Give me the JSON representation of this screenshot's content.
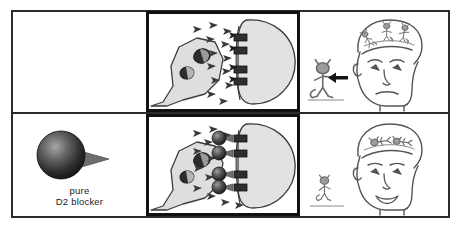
{
  "figure": {
    "type": "two-row comic panel diagram",
    "rows": [
      {
        "id": "row-untreated",
        "label": "untreated",
        "cells": [
          {
            "id": "top-left",
            "name": "empty-cell",
            "content": "",
            "description": "blank panel (no drug present)"
          },
          {
            "id": "top-middle",
            "name": "synapse-panel-untreated",
            "description": "dopamine synapse with free dopamine in cleft binding open D2 receptors",
            "elements": {
              "presynaptic_terminal": "presynaptic-neuron-terminal",
              "vesicles": 2,
              "neurotransmitter_count": 13,
              "receptor_count": 4,
              "receptors_occupied_by_blocker": 0,
              "postsynaptic_cell": "postsynaptic-neuron"
            }
          },
          {
            "id": "top-right",
            "name": "patient-panel-symptomatic",
            "description": "worried face with three active demons dancing on head and one demon beside head with arrow",
            "elements": {
              "face_expression": "worried",
              "demons_on_head": 3,
              "demons_beside_head": 1,
              "arrow": "arrow-pointing-to-demon"
            }
          }
        ]
      },
      {
        "id": "row-treated",
        "label": "treated with pure D2 blocker",
        "cells": [
          {
            "id": "bottom-left",
            "name": "drug-icon-cell",
            "description": "dark sphere with gray tail representing the drug molecule",
            "label_line1": "pure",
            "label_line2": "D2 blocker"
          },
          {
            "id": "bottom-middle",
            "name": "synapse-panel-blocked",
            "description": "dopamine synapse with D2 receptors occupied by blocker molecules; dopamine remains unbound in cleft",
            "elements": {
              "presynaptic_terminal": "presynaptic-neuron-terminal",
              "vesicles": 2,
              "neurotransmitter_count": 12,
              "receptor_count": 4,
              "receptors_occupied_by_blocker": 4,
              "postsynaptic_cell": "postsynaptic-neuron"
            }
          },
          {
            "id": "bottom-right",
            "name": "patient-panel-improved",
            "description": "smiling face with subdued flattened demons on head and one quiet demon beside head",
            "elements": {
              "face_expression": "smiling",
              "demons_on_head": 2,
              "demons_beside_head": 1,
              "arrow": "none"
            }
          }
        ]
      }
    ],
    "drug_label": {
      "line1": "pure",
      "line2": "D2 blocker"
    },
    "colors": {
      "frame": "#2b2b2b",
      "panel_border": "#111111",
      "cell_fill": "#d9d9d9",
      "neuron_fill": "#e0e0e0",
      "neurotransmitter": "#3a3a3a",
      "receptor": "#2f2f2f",
      "blocker_sphere_dark": "#1e1e1e",
      "blocker_sphere_light": "#8e8e8e",
      "blocker_tail": "#6b6b6b",
      "figure_gray": "#8a8a8a",
      "outline": "#4a4a4a",
      "background": "#ffffff"
    }
  }
}
